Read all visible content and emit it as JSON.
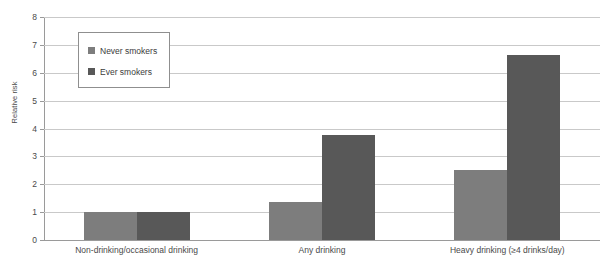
{
  "chart_data": {
    "type": "bar",
    "title": "",
    "xlabel": "",
    "ylabel": "Relative risk",
    "ylim": [
      0,
      8
    ],
    "yticks": [
      0,
      1,
      2,
      3,
      4,
      5,
      6,
      7,
      8
    ],
    "grid": true,
    "legend_position": "upper-left-inside",
    "categories": [
      "Non-drinking/occasional drinking",
      "Any drinking",
      "Heavy drinking (≥4 drinks/day)"
    ],
    "series": [
      {
        "name": "Never smokers",
        "color": "#7d7d7d",
        "values": [
          1.0,
          1.35,
          2.5
        ]
      },
      {
        "name": "Ever smokers",
        "color": "#585858",
        "values": [
          1.0,
          3.75,
          6.65
        ]
      }
    ]
  },
  "axis": {
    "y_title": "Relative risk",
    "tick_labels": [
      "8",
      "7",
      "6",
      "5",
      "4",
      "3",
      "2",
      "1",
      "0"
    ]
  },
  "legend": {
    "items": [
      {
        "label": "Never smokers"
      },
      {
        "label": "Ever smokers"
      }
    ]
  },
  "colors": {
    "never_smokers": "#7d7d7d",
    "ever_smokers": "#585858",
    "gridline": "#c9c9c9",
    "axis": "#9a9a9a",
    "text": "#4a4a4a"
  }
}
